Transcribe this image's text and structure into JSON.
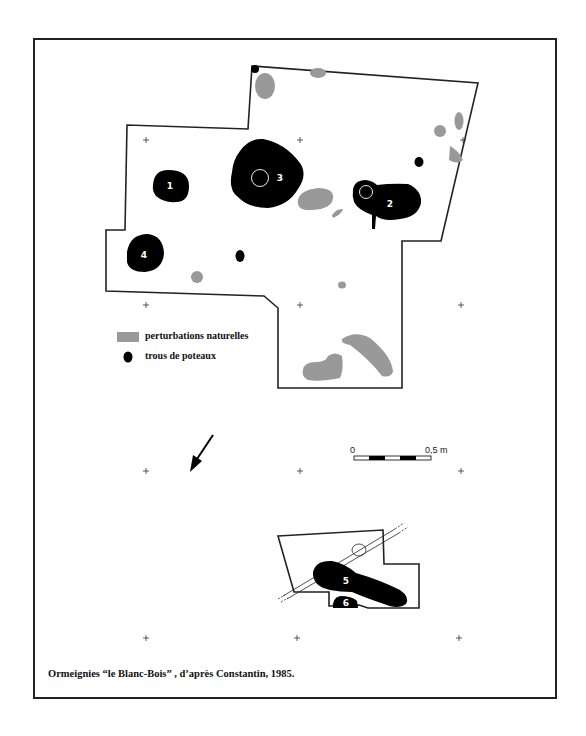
{
  "figure": {
    "caption": "Ormeignies “le Blanc-Bois” ,  d’après Constantin, 1985.",
    "colors": {
      "post_hole": "#000000",
      "natural_disturbance": "#999999",
      "outline": "#222222",
      "background": "#ffffff"
    }
  },
  "legend": {
    "items": [
      {
        "label": "perturbations naturelles",
        "symbol": "grey-patch"
      },
      {
        "label": "trous de poteaux",
        "symbol": "black-dot"
      }
    ]
  },
  "features": {
    "upper_plan": {
      "post_holes": [
        {
          "id": "1",
          "label": "1"
        },
        {
          "id": "2",
          "label": "2"
        },
        {
          "id": "3",
          "label": "3"
        },
        {
          "id": "4",
          "label": "4"
        }
      ]
    },
    "lower_plan": {
      "post_holes": [
        {
          "id": "5",
          "label": "5"
        },
        {
          "id": "6",
          "label": "6"
        }
      ]
    }
  },
  "scale_bar": {
    "start_label": "0",
    "end_label": "0,5 m"
  },
  "north_arrow": {
    "icon": "arrow-down-left"
  }
}
